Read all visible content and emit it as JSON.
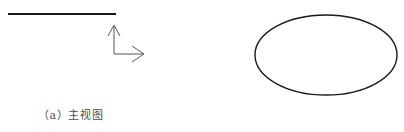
{
  "page": {
    "width": 404,
    "height": 132,
    "background_color": "#ffffff",
    "type": "engineering-drawing-figure-pair"
  },
  "figures": [
    {
      "id": "front-view",
      "caption": "（a）主视图",
      "caption_color": "#4a4a4a",
      "stroke_color": "#1a1a1a",
      "shapes": [
        {
          "name": "horizontal-edge-line",
          "type": "line",
          "x1": 8,
          "y1": 14,
          "x2": 116,
          "y2": 14,
          "stroke_width": 2.2
        },
        {
          "name": "axis-vertical-shaft",
          "type": "line",
          "x1": 114,
          "y1": 54,
          "x2": 114,
          "y2": 27,
          "stroke_width": 1
        },
        {
          "name": "axis-horizontal-shaft",
          "type": "line",
          "x1": 114,
          "y1": 54,
          "x2": 143,
          "y2": 54,
          "stroke_width": 1
        },
        {
          "name": "axis-vertical-arrowhead",
          "type": "polyline",
          "points": "108,36 114,25 120,36",
          "stroke_width": 1
        },
        {
          "name": "axis-horizontal-arrowhead",
          "type": "polyline",
          "points": "132,46 144,54 132,62",
          "stroke_width": 1
        }
      ]
    },
    {
      "id": "left-view",
      "caption": "（b）左视图",
      "caption_color": "#4a4a4a",
      "stroke_color": "#1a1a1a",
      "shapes": [
        {
          "name": "ellipse-outline",
          "type": "ellipse",
          "cx": 124,
          "cy": 55,
          "rx": 71,
          "ry": 40,
          "stroke_width": 1.4,
          "fill": "none"
        }
      ]
    }
  ]
}
